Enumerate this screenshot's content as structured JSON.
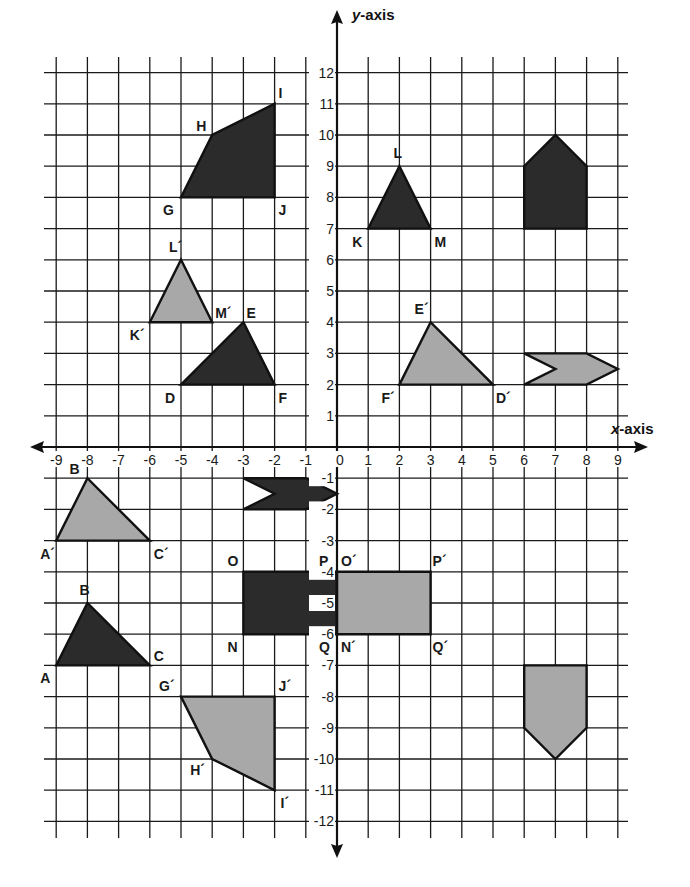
{
  "diagram": {
    "type": "coordinate-plane-transformations",
    "x_axis_label": "x-axis",
    "y_axis_label": "y-axis",
    "x_range": [
      -9,
      9
    ],
    "y_range": [
      -12,
      12
    ],
    "x_ticks": [
      "-9",
      "-8",
      "-7",
      "-6",
      "-5",
      "-4",
      "-3",
      "-2",
      "-1",
      "0",
      "1",
      "2",
      "3",
      "4",
      "5",
      "6",
      "7",
      "8",
      "9"
    ],
    "y_ticks": [
      "12",
      "11",
      "10",
      "9",
      "8",
      "7",
      "6",
      "5",
      "4",
      "3",
      "2",
      "1",
      "-1",
      "-2",
      "-3",
      "-4",
      "-5",
      "-6",
      "-7",
      "-8",
      "-9",
      "-10",
      "-11",
      "-12"
    ],
    "colors": {
      "original_fill": "#2b2b2b",
      "image_fill": "#a8a8a8",
      "grid": "#1a1a1a",
      "background": "#ffffff"
    },
    "shapes": [
      {
        "name": "quadrilateral-GHIJ",
        "kind": "original",
        "points": [
          [
            -5,
            8
          ],
          [
            -4,
            10
          ],
          [
            -2,
            11
          ],
          [
            -2,
            8
          ]
        ]
      },
      {
        "name": "triangle-KLM",
        "kind": "original",
        "points": [
          [
            1,
            7
          ],
          [
            2,
            9
          ],
          [
            3,
            7
          ]
        ]
      },
      {
        "name": "pentagon-q1",
        "kind": "original",
        "points": [
          [
            6,
            7
          ],
          [
            6,
            9
          ],
          [
            7,
            10
          ],
          [
            8,
            9
          ],
          [
            8,
            7
          ]
        ]
      },
      {
        "name": "triangle-KLM-prime",
        "kind": "image",
        "points": [
          [
            -6,
            4
          ],
          [
            -5,
            6
          ],
          [
            -4,
            4
          ]
        ]
      },
      {
        "name": "triangle-DEF",
        "kind": "original",
        "points": [
          [
            -5,
            2
          ],
          [
            -3,
            4
          ],
          [
            -2,
            2
          ]
        ]
      },
      {
        "name": "triangle-DEF-prime",
        "kind": "image",
        "points": [
          [
            2,
            2
          ],
          [
            3,
            4
          ],
          [
            5,
            2
          ]
        ]
      },
      {
        "name": "arrow-q1",
        "kind": "image",
        "points": [
          [
            6,
            3
          ],
          [
            8,
            3
          ],
          [
            9,
            2.5
          ],
          [
            8,
            2
          ],
          [
            6,
            2
          ],
          [
            7,
            2.5
          ]
        ]
      },
      {
        "name": "triangle-ABC-prime",
        "kind": "image",
        "points": [
          [
            -9,
            -3
          ],
          [
            -8,
            -1
          ],
          [
            -6,
            -3
          ]
        ]
      },
      {
        "name": "arrow-q3",
        "kind": "original",
        "points": [
          [
            -3,
            -1
          ],
          [
            -1,
            -1
          ],
          [
            0,
            -1.5
          ],
          [
            -1,
            -2
          ],
          [
            -3,
            -2
          ],
          [
            -2,
            -1.5
          ]
        ]
      },
      {
        "name": "rectangle-NOPQ",
        "kind": "original",
        "points": [
          [
            -3,
            -4
          ],
          [
            0,
            -4
          ],
          [
            0,
            -6
          ],
          [
            -3,
            -6
          ]
        ]
      },
      {
        "name": "rectangle-NOPQ-prime",
        "kind": "image",
        "points": [
          [
            0,
            -4
          ],
          [
            3,
            -4
          ],
          [
            3,
            -6
          ],
          [
            0,
            -6
          ]
        ]
      },
      {
        "name": "triangle-ABC",
        "kind": "original",
        "points": [
          [
            -9,
            -7
          ],
          [
            -8,
            -5
          ],
          [
            -6,
            -7
          ]
        ]
      },
      {
        "name": "quadrilateral-GHIJ-prime",
        "kind": "image",
        "points": [
          [
            -5,
            -8
          ],
          [
            -2,
            -8
          ],
          [
            -2,
            -11
          ],
          [
            -4,
            -10
          ]
        ]
      },
      {
        "name": "pentagon-q4",
        "kind": "image",
        "points": [
          [
            6,
            -7
          ],
          [
            8,
            -7
          ],
          [
            8,
            -9
          ],
          [
            7,
            -10
          ],
          [
            6,
            -9
          ]
        ]
      }
    ],
    "labels": [
      {
        "text": "I",
        "x": -2,
        "y": 11,
        "dx": 4,
        "dy": -6
      },
      {
        "text": "H",
        "x": -4,
        "y": 10,
        "dx": -16,
        "dy": -4
      },
      {
        "text": "G",
        "x": -5,
        "y": 8,
        "dx": -18,
        "dy": 18
      },
      {
        "text": "J",
        "x": -2,
        "y": 8,
        "dx": 4,
        "dy": 18
      },
      {
        "text": "L",
        "x": 2,
        "y": 9,
        "dx": -6,
        "dy": -8
      },
      {
        "text": "K",
        "x": 1,
        "y": 7,
        "dx": -16,
        "dy": 18
      },
      {
        "text": "M",
        "x": 3,
        "y": 7,
        "dx": 4,
        "dy": 18
      },
      {
        "text": "L´",
        "x": -5,
        "y": 6,
        "dx": -12,
        "dy": -8
      },
      {
        "text": "K´",
        "x": -6,
        "y": 4,
        "dx": -20,
        "dy": 18
      },
      {
        "text": "M´",
        "x": -4,
        "y": 4,
        "dx": 3,
        "dy": -4
      },
      {
        "text": "E",
        "x": -3,
        "y": 4,
        "dx": 3,
        "dy": -4
      },
      {
        "text": "D",
        "x": -5,
        "y": 2,
        "dx": -16,
        "dy": 18
      },
      {
        "text": "F",
        "x": -2,
        "y": 2,
        "dx": 4,
        "dy": 18
      },
      {
        "text": "E´",
        "x": 3,
        "y": 4,
        "dx": -16,
        "dy": -8
      },
      {
        "text": "F´",
        "x": 2,
        "y": 2,
        "dx": -18,
        "dy": 18
      },
      {
        "text": "D´",
        "x": 5,
        "y": 2,
        "dx": 3,
        "dy": 18
      },
      {
        "text": "B",
        "x": -8,
        "y": -1,
        "dx": -18,
        "dy": -4
      },
      {
        "text": "A´",
        "x": -9,
        "y": -3,
        "dx": -16,
        "dy": 18
      },
      {
        "text": "C´",
        "x": -6,
        "y": -3,
        "dx": 4,
        "dy": 18
      },
      {
        "text": "O",
        "x": -3,
        "y": -4,
        "dx": -16,
        "dy": -6
      },
      {
        "text": "P",
        "x": 0,
        "y": -4,
        "dx": -18,
        "dy": -6
      },
      {
        "text": "O´",
        "x": 0,
        "y": -4,
        "dx": 4,
        "dy": -6
      },
      {
        "text": "P´",
        "x": 3,
        "y": -4,
        "dx": 2,
        "dy": -6
      },
      {
        "text": "N",
        "x": -3,
        "y": -6,
        "dx": -16,
        "dy": 18
      },
      {
        "text": "Q",
        "x": 0,
        "y": -6,
        "dx": -18,
        "dy": 18
      },
      {
        "text": "N´",
        "x": 0,
        "y": -6,
        "dx": 4,
        "dy": 18
      },
      {
        "text": "Q´",
        "x": 3,
        "y": -6,
        "dx": 2,
        "dy": 18
      },
      {
        "text": "B",
        "x": -8,
        "y": -5,
        "dx": -8,
        "dy": -8
      },
      {
        "text": "A",
        "x": -9,
        "y": -7,
        "dx": -16,
        "dy": 18
      },
      {
        "text": "C",
        "x": -6,
        "y": -7,
        "dx": 4,
        "dy": -4
      },
      {
        "text": "G´",
        "x": -5,
        "y": -8,
        "dx": -22,
        "dy": -6
      },
      {
        "text": "J´",
        "x": -2,
        "y": -8,
        "dx": 4,
        "dy": -6
      },
      {
        "text": "H´",
        "x": -4,
        "y": -10,
        "dx": -22,
        "dy": 16
      },
      {
        "text": "I´",
        "x": -2,
        "y": -11,
        "dx": 6,
        "dy": 18
      }
    ]
  }
}
